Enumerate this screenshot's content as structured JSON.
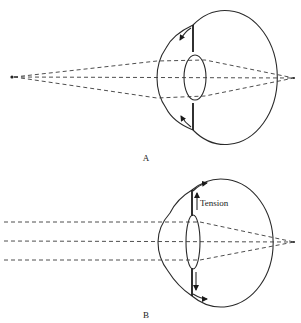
{
  "figure": {
    "panels": [
      {
        "id": "A",
        "caption": "A",
        "description": "Eye focused on near object: diverging rays from a point source, lens thick and rounded, ciliary muscle contracted"
      },
      {
        "id": "B",
        "caption": "B",
        "description": "Eye focused on distant object: parallel rays, lens flattened under zonular tension",
        "annotation": "Tension"
      }
    ]
  }
}
